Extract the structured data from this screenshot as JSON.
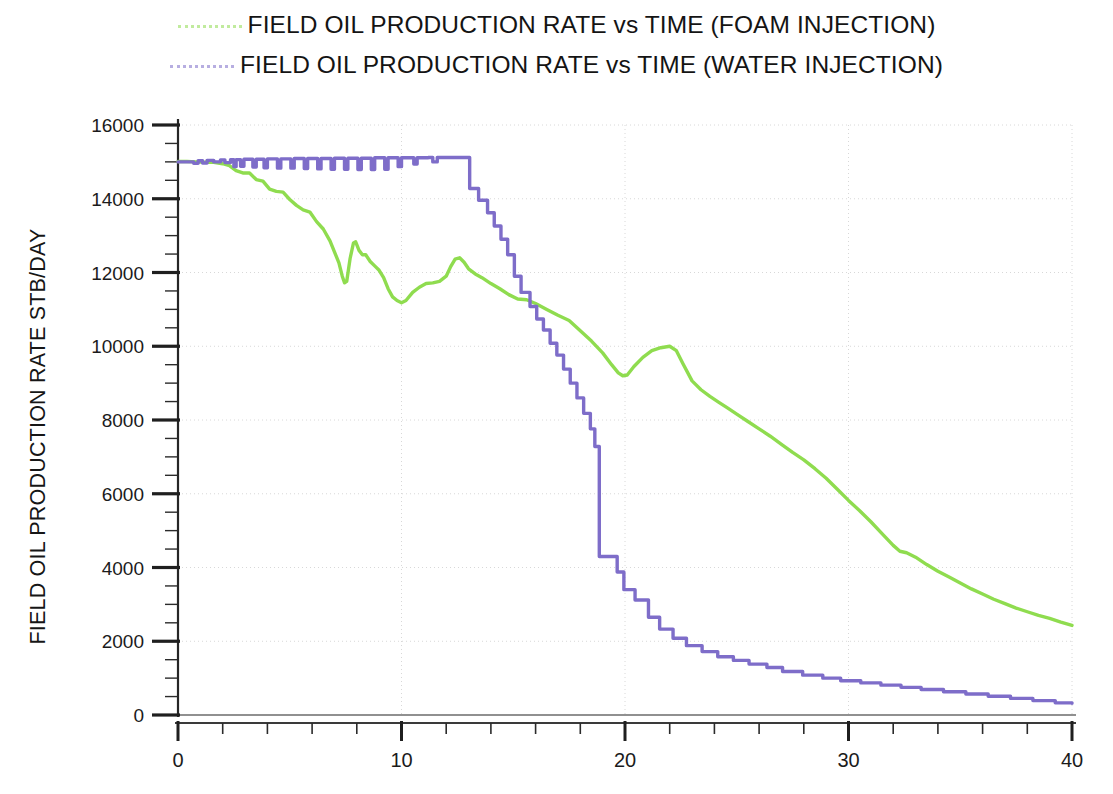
{
  "legend": {
    "items": [
      {
        "label": "FIELD  OIL  PRODUCTION RATE vs  TIME (FOAM INJECTION)",
        "color": "#8fdc4f",
        "sample": "dotted-line-sample"
      },
      {
        "label": "FIELD  OIL PRODUCTION RATE vs  TIME (WATER INJECTION)",
        "color": "#7e6dc9",
        "sample": "dotted-line-sample"
      }
    ]
  },
  "axes": {
    "x_title": "TIME YEARS",
    "y_title": "FIELD OIL PRODUCTION RATE STB/DAY",
    "x_ticks": [
      "0",
      "10",
      "20",
      "30",
      "40"
    ],
    "y_ticks": [
      "0",
      "2000",
      "4000",
      "6000",
      "8000",
      "10000",
      "12000",
      "14000",
      "16000"
    ]
  },
  "chart_data": {
    "type": "line",
    "title": "",
    "xlabel": "TIME YEARS",
    "ylabel": "FIELD OIL PRODUCTION RATE STB/DAY",
    "xlim": [
      0,
      40
    ],
    "ylim": [
      0,
      16000
    ],
    "xticks": [
      0,
      10,
      20,
      30,
      40
    ],
    "xtick_minor_step": 2,
    "yticks": [
      0,
      2000,
      4000,
      6000,
      8000,
      10000,
      12000,
      14000,
      16000
    ],
    "ytick_minor_step": 500,
    "grid": true,
    "legend_position": "above-plot",
    "series": [
      {
        "name": "FIELD OIL PRODUCTION RATE vs TIME (FOAM INJECTION)",
        "color": "#8fdc4f",
        "style": "stepped-smooth",
        "points": [
          [
            0.0,
            15010
          ],
          [
            0.4,
            15010
          ],
          [
            0.8,
            15000
          ],
          [
            1.2,
            14990
          ],
          [
            1.6,
            14990
          ],
          [
            2.0,
            14950
          ],
          [
            2.3,
            14900
          ],
          [
            2.6,
            14760
          ],
          [
            2.9,
            14700
          ],
          [
            3.2,
            14700
          ],
          [
            3.5,
            14520
          ],
          [
            3.8,
            14480
          ],
          [
            4.1,
            14260
          ],
          [
            4.4,
            14200
          ],
          [
            4.7,
            14180
          ],
          [
            5.0,
            13980
          ],
          [
            5.3,
            13820
          ],
          [
            5.6,
            13700
          ],
          [
            5.9,
            13640
          ],
          [
            6.2,
            13380
          ],
          [
            6.5,
            13180
          ],
          [
            6.8,
            12860
          ],
          [
            7.0,
            12560
          ],
          [
            7.2,
            12260
          ],
          [
            7.35,
            11900
          ],
          [
            7.45,
            11720
          ],
          [
            7.55,
            11760
          ],
          [
            7.7,
            12380
          ],
          [
            7.85,
            12800
          ],
          [
            7.95,
            12830
          ],
          [
            8.1,
            12600
          ],
          [
            8.25,
            12480
          ],
          [
            8.4,
            12480
          ],
          [
            8.6,
            12300
          ],
          [
            8.8,
            12180
          ],
          [
            9.0,
            12060
          ],
          [
            9.2,
            11860
          ],
          [
            9.4,
            11560
          ],
          [
            9.6,
            11340
          ],
          [
            9.8,
            11240
          ],
          [
            10.0,
            11180
          ],
          [
            10.2,
            11240
          ],
          [
            10.5,
            11460
          ],
          [
            10.8,
            11600
          ],
          [
            11.1,
            11700
          ],
          [
            11.4,
            11720
          ],
          [
            11.7,
            11760
          ],
          [
            12.0,
            11900
          ],
          [
            12.2,
            12160
          ],
          [
            12.4,
            12360
          ],
          [
            12.6,
            12400
          ],
          [
            12.8,
            12280
          ],
          [
            13.0,
            12100
          ],
          [
            13.3,
            11960
          ],
          [
            13.6,
            11860
          ],
          [
            14.0,
            11700
          ],
          [
            14.4,
            11560
          ],
          [
            14.8,
            11400
          ],
          [
            15.2,
            11280
          ],
          [
            15.6,
            11260
          ],
          [
            16.0,
            11160
          ],
          [
            16.5,
            11000
          ],
          [
            17.0,
            10840
          ],
          [
            17.5,
            10700
          ],
          [
            18.0,
            10420
          ],
          [
            18.5,
            10140
          ],
          [
            19.0,
            9820
          ],
          [
            19.4,
            9500
          ],
          [
            19.7,
            9280
          ],
          [
            19.9,
            9200
          ],
          [
            20.1,
            9220
          ],
          [
            20.4,
            9450
          ],
          [
            20.8,
            9700
          ],
          [
            21.2,
            9880
          ],
          [
            21.6,
            9960
          ],
          [
            22.0,
            10000
          ],
          [
            22.3,
            9880
          ],
          [
            22.6,
            9520
          ],
          [
            23.0,
            9060
          ],
          [
            23.4,
            8820
          ],
          [
            23.8,
            8640
          ],
          [
            24.2,
            8480
          ],
          [
            24.6,
            8320
          ],
          [
            25.0,
            8160
          ],
          [
            25.5,
            7960
          ],
          [
            26.0,
            7760
          ],
          [
            26.5,
            7560
          ],
          [
            27.0,
            7340
          ],
          [
            27.5,
            7120
          ],
          [
            28.0,
            6920
          ],
          [
            28.5,
            6680
          ],
          [
            29.0,
            6420
          ],
          [
            29.5,
            6120
          ],
          [
            30.0,
            5820
          ],
          [
            30.5,
            5540
          ],
          [
            31.0,
            5240
          ],
          [
            31.5,
            4920
          ],
          [
            32.0,
            4600
          ],
          [
            32.3,
            4440
          ],
          [
            32.6,
            4400
          ],
          [
            33.0,
            4280
          ],
          [
            33.5,
            4080
          ],
          [
            34.0,
            3900
          ],
          [
            34.5,
            3740
          ],
          [
            35.0,
            3580
          ],
          [
            35.5,
            3420
          ],
          [
            36.0,
            3280
          ],
          [
            36.5,
            3140
          ],
          [
            37.0,
            3020
          ],
          [
            37.5,
            2900
          ],
          [
            38.0,
            2800
          ],
          [
            38.5,
            2700
          ],
          [
            39.0,
            2620
          ],
          [
            39.5,
            2520
          ],
          [
            40.0,
            2430
          ]
        ]
      },
      {
        "name": "FIELD OIL PRODUCTION RATE vs TIME (WATER INJECTION)",
        "color": "#7e6dc9",
        "style": "staircase",
        "points": [
          [
            0.0,
            15000
          ],
          [
            0.5,
            15000
          ],
          [
            0.7,
            14960
          ],
          [
            0.9,
            15030
          ],
          [
            1.1,
            14970
          ],
          [
            1.3,
            15040
          ],
          [
            1.6,
            15000
          ],
          [
            1.9,
            15050
          ],
          [
            2.1,
            14980
          ],
          [
            2.35,
            15060
          ],
          [
            2.5,
            14870
          ],
          [
            2.6,
            15060
          ],
          [
            2.8,
            14880
          ],
          [
            2.95,
            15070
          ],
          [
            3.2,
            15070
          ],
          [
            3.35,
            14860
          ],
          [
            3.5,
            15070
          ],
          [
            3.7,
            15070
          ],
          [
            3.85,
            14840
          ],
          [
            4.0,
            15080
          ],
          [
            4.3,
            15080
          ],
          [
            4.45,
            14830
          ],
          [
            4.6,
            15080
          ],
          [
            4.9,
            15080
          ],
          [
            5.05,
            14830
          ],
          [
            5.2,
            15090
          ],
          [
            5.5,
            15090
          ],
          [
            5.65,
            14820
          ],
          [
            5.8,
            15090
          ],
          [
            6.1,
            15090
          ],
          [
            6.25,
            14810
          ],
          [
            6.4,
            15090
          ],
          [
            6.7,
            15090
          ],
          [
            6.85,
            14800
          ],
          [
            7.0,
            15100
          ],
          [
            7.3,
            15100
          ],
          [
            7.45,
            14800
          ],
          [
            7.6,
            15100
          ],
          [
            7.9,
            15100
          ],
          [
            8.05,
            14790
          ],
          [
            8.2,
            15100
          ],
          [
            8.5,
            15100
          ],
          [
            8.65,
            14790
          ],
          [
            8.8,
            15110
          ],
          [
            9.1,
            15110
          ],
          [
            9.25,
            14800
          ],
          [
            9.4,
            15110
          ],
          [
            9.7,
            15110
          ],
          [
            9.85,
            14870
          ],
          [
            10.0,
            15110
          ],
          [
            10.4,
            15110
          ],
          [
            10.55,
            14940
          ],
          [
            10.7,
            15110
          ],
          [
            11.2,
            15120
          ],
          [
            11.4,
            15000
          ],
          [
            11.6,
            15120
          ],
          [
            12.0,
            15120
          ],
          [
            12.4,
            15120
          ],
          [
            12.8,
            15120
          ],
          [
            13.0,
            15120
          ],
          [
            13.05,
            14280
          ],
          [
            13.4,
            14280
          ],
          [
            13.45,
            13960
          ],
          [
            13.8,
            13960
          ],
          [
            13.85,
            13620
          ],
          [
            14.1,
            13620
          ],
          [
            14.15,
            13260
          ],
          [
            14.4,
            13260
          ],
          [
            14.45,
            12900
          ],
          [
            14.7,
            12900
          ],
          [
            14.75,
            12480
          ],
          [
            15.0,
            12480
          ],
          [
            15.05,
            11900
          ],
          [
            15.3,
            11900
          ],
          [
            15.35,
            11460
          ],
          [
            15.7,
            11460
          ],
          [
            15.75,
            11080
          ],
          [
            16.0,
            11080
          ],
          [
            16.05,
            10740
          ],
          [
            16.3,
            10740
          ],
          [
            16.35,
            10440
          ],
          [
            16.6,
            10440
          ],
          [
            16.65,
            10080
          ],
          [
            16.9,
            10080
          ],
          [
            16.95,
            9760
          ],
          [
            17.2,
            9760
          ],
          [
            17.25,
            9380
          ],
          [
            17.5,
            9380
          ],
          [
            17.55,
            9000
          ],
          [
            17.8,
            9000
          ],
          [
            17.85,
            8600
          ],
          [
            18.1,
            8600
          ],
          [
            18.15,
            8180
          ],
          [
            18.4,
            8180
          ],
          [
            18.45,
            7760
          ],
          [
            18.6,
            7760
          ],
          [
            18.65,
            7280
          ],
          [
            18.8,
            7280
          ],
          [
            18.85,
            4300
          ],
          [
            19.6,
            4300
          ],
          [
            19.65,
            3880
          ],
          [
            19.9,
            3880
          ],
          [
            19.95,
            3400
          ],
          [
            20.4,
            3400
          ],
          [
            20.45,
            3120
          ],
          [
            21.0,
            3120
          ],
          [
            21.05,
            2650
          ],
          [
            21.5,
            2650
          ],
          [
            21.55,
            2330
          ],
          [
            22.1,
            2330
          ],
          [
            22.15,
            2080
          ],
          [
            22.7,
            2080
          ],
          [
            22.75,
            1880
          ],
          [
            23.4,
            1880
          ],
          [
            23.45,
            1720
          ],
          [
            24.1,
            1720
          ],
          [
            24.15,
            1580
          ],
          [
            24.8,
            1580
          ],
          [
            24.85,
            1480
          ],
          [
            25.5,
            1480
          ],
          [
            25.55,
            1380
          ],
          [
            26.3,
            1380
          ],
          [
            26.35,
            1290
          ],
          [
            27.0,
            1290
          ],
          [
            27.05,
            1180
          ],
          [
            27.9,
            1180
          ],
          [
            27.95,
            1080
          ],
          [
            28.8,
            1080
          ],
          [
            28.85,
            1000
          ],
          [
            29.6,
            1000
          ],
          [
            29.65,
            930
          ],
          [
            30.5,
            930
          ],
          [
            30.55,
            870
          ],
          [
            31.4,
            870
          ],
          [
            31.45,
            810
          ],
          [
            32.3,
            810
          ],
          [
            32.35,
            750
          ],
          [
            33.2,
            750
          ],
          [
            33.25,
            690
          ],
          [
            34.2,
            690
          ],
          [
            34.25,
            630
          ],
          [
            35.2,
            630
          ],
          [
            35.25,
            570
          ],
          [
            36.2,
            570
          ],
          [
            36.25,
            510
          ],
          [
            37.2,
            510
          ],
          [
            37.25,
            450
          ],
          [
            38.2,
            450
          ],
          [
            38.25,
            390
          ],
          [
            39.2,
            390
          ],
          [
            39.25,
            330
          ],
          [
            40.0,
            320
          ]
        ]
      }
    ]
  }
}
